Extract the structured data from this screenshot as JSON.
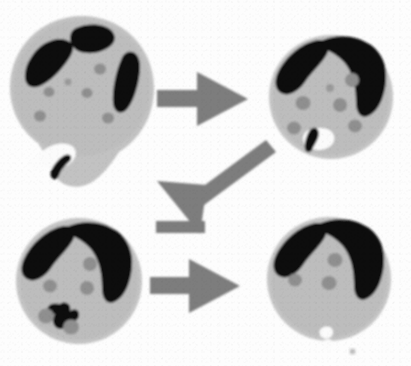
{
  "figure": {
    "title": "Cell morphology progression micrograph series",
    "description": "Four schematic rounded cells arranged in a two-by-two grid, connected by three thick grey arrows showing a progression sequence.",
    "background_color": "#fdfdfd",
    "colors": {
      "background": "#fdfdfd",
      "cytoplasm": "#bfbfbf",
      "cytoplasm_rim": "#c9c9c9",
      "dark_blob": "#111111",
      "granule": "#8c8c8c",
      "arrow": "#7a7a7a",
      "vacuole_white": "#fbfbfb"
    }
  },
  "panels": [
    {
      "id": "panel-1",
      "label": "top-left-cell",
      "position": "top-left",
      "stage": "1",
      "center": {
        "x": 82,
        "y": 88
      },
      "radius": 72,
      "shape": "round cell with basal tail protrusion",
      "dark_blob_count": 3,
      "granule_count": 6,
      "has_white_vacuole": true,
      "has_basal_protrusion": true,
      "notes": "Three separate dark chromatin lobes spread across the upper half; scattered grey granules; white notch with small dark comma-shaped body at the lower-left pole."
    },
    {
      "id": "panel-2",
      "label": "top-right-cell",
      "position": "top-right",
      "stage": "2",
      "center": {
        "x": 330,
        "y": 96
      },
      "radius": 62,
      "shape": "round cell",
      "dark_blob_count": 2,
      "granule_count": 6,
      "has_white_vacuole": true,
      "has_basal_protrusion": false,
      "notes": "Dark chromatin condensed into a continuous horseshoe cap over the top; grey granules below; small dark comma body beside a white vacuole at lower-left."
    },
    {
      "id": "panel-3",
      "label": "bottom-left-cell",
      "position": "bottom-left",
      "stage": "3",
      "center": {
        "x": 79,
        "y": 281
      },
      "radius": 63,
      "shape": "round cell",
      "dark_blob_count": 2,
      "granule_count": 5,
      "has_white_vacuole": false,
      "has_basal_protrusion": false,
      "notes": "Horseshoe chromatin cap over the top; irregular dark star-shaped body with grey granules clustered at the lower-left of the cell."
    },
    {
      "id": "panel-4",
      "label": "bottom-right-cell",
      "position": "bottom-right",
      "stage": "4",
      "center": {
        "x": 329,
        "y": 279
      },
      "radius": 62,
      "shape": "round cell",
      "dark_blob_count": 2,
      "granule_count": 3,
      "has_white_vacuole": true,
      "has_basal_protrusion": false,
      "notes": "Horseshoe chromatin cap over the top; only three grey granules remain; a small white notch at the basal margin."
    }
  ],
  "arrows": [
    {
      "id": "arrow-1",
      "label": "arrow-top-row",
      "direction": "right",
      "from": "panel-1",
      "to": "panel-2",
      "from_x": 157,
      "from_y": 98,
      "to_x": 248,
      "to_y": 98
    },
    {
      "id": "arrow-2",
      "label": "arrow-diagonal",
      "direction": "down-left",
      "from": "panel-2",
      "to": "panel-3",
      "from_x": 272,
      "from_y": 145,
      "to_x": 163,
      "to_y": 218
    },
    {
      "id": "arrow-3",
      "label": "arrow-bottom-row",
      "direction": "right",
      "from": "panel-3",
      "to": "panel-4",
      "from_x": 150,
      "from_y": 285,
      "to_x": 240,
      "to_y": 285
    }
  ],
  "marks": [
    {
      "id": "speck-1",
      "label": "stray-speck",
      "x": 352,
      "y": 351,
      "size": 5
    }
  ]
}
